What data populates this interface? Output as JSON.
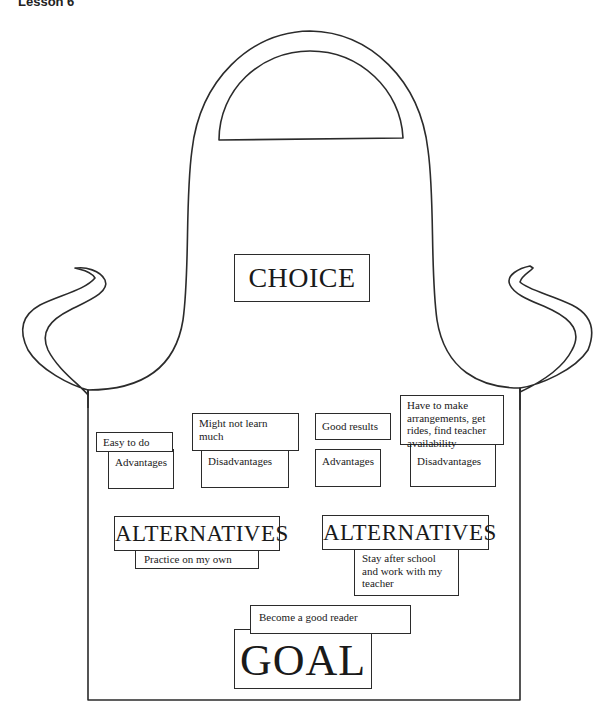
{
  "header": {
    "lesson_label": "Lesson 6"
  },
  "diagram": {
    "shape": "apron",
    "choice": {
      "label": "CHOICE"
    },
    "alternatives": [
      {
        "heading": "ALTERNATIVES",
        "text": "Practice on my own",
        "advantages": {
          "label": "Advantages",
          "text": "Easy to do"
        },
        "disadvantages": {
          "label": "Disadvantages",
          "text": "Might not learn much"
        }
      },
      {
        "heading": "ALTERNATIVES",
        "text": "Stay after school and work with my teacher",
        "advantages": {
          "label": "Advantages",
          "text": "Good results"
        },
        "disadvantages": {
          "label": "Disadvantages",
          "text": "Have to make arrangements, get rides, find teacher availability"
        }
      }
    ],
    "goal": {
      "label": "GOAL",
      "text": "Become a good reader"
    }
  }
}
